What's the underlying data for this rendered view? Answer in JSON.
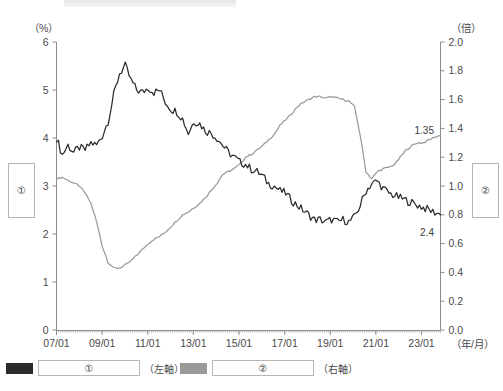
{
  "axes": {
    "left_unit": "（%）",
    "right_unit": "（倍）",
    "x_unit": "（年/月）",
    "left_ticks": [
      "0",
      "1",
      "2",
      "3",
      "4",
      "5",
      "6"
    ],
    "right_ticks": [
      "0.0",
      "0.2",
      "0.4",
      "0.6",
      "0.8",
      "1.0",
      "1.2",
      "1.4",
      "1.6",
      "1.8",
      "2.0"
    ],
    "x_ticks": [
      "07/01",
      "09/01",
      "11/01",
      "13/01",
      "15/01",
      "17/01",
      "19/01",
      "21/01",
      "23/01"
    ]
  },
  "annotations": {
    "series2_end": "1.35",
    "series1_end": "2.4"
  },
  "side_boxes": {
    "left": "①",
    "right": "②"
  },
  "legend": {
    "items": [
      {
        "swatch": "#2b2b2b",
        "key": "①",
        "axis": "（左軸）"
      },
      {
        "swatch": "#9a9a9a",
        "key": "②",
        "axis": "（右軸）"
      }
    ]
  },
  "chart_data": {
    "type": "line",
    "title": "",
    "xlabel": "（年/月）",
    "ylabel": "（%）",
    "y2label": "（倍）",
    "ylim": [
      0,
      6
    ],
    "y2lim": [
      0.0,
      2.0
    ],
    "xlim": [
      "07/01",
      "23/10"
    ],
    "grid": false,
    "legend_position": "bottom-left",
    "x": [
      "07/01",
      "07/04",
      "07/07",
      "07/10",
      "08/01",
      "08/04",
      "08/07",
      "08/10",
      "09/01",
      "09/04",
      "09/07",
      "09/10",
      "10/01",
      "10/04",
      "10/07",
      "10/10",
      "11/01",
      "11/04",
      "11/07",
      "11/10",
      "12/01",
      "12/04",
      "12/07",
      "12/10",
      "13/01",
      "13/04",
      "13/07",
      "13/10",
      "14/01",
      "14/04",
      "14/07",
      "14/10",
      "15/01",
      "15/04",
      "15/07",
      "15/10",
      "16/01",
      "16/04",
      "16/07",
      "16/10",
      "17/01",
      "17/04",
      "17/07",
      "17/10",
      "18/01",
      "18/04",
      "18/07",
      "18/10",
      "19/01",
      "19/04",
      "19/07",
      "19/10",
      "20/01",
      "20/04",
      "20/07",
      "20/10",
      "21/01",
      "21/04",
      "21/07",
      "21/10",
      "22/01",
      "22/04",
      "22/07",
      "22/10",
      "23/01",
      "23/04",
      "23/07",
      "23/10"
    ],
    "series": [
      {
        "name": "①",
        "axis": "left",
        "color": "#2b2b2b",
        "unit": "%",
        "end_label": "2.4",
        "values": [
          4.0,
          3.65,
          3.85,
          3.7,
          3.8,
          3.75,
          3.9,
          3.85,
          4.05,
          4.35,
          4.9,
          5.35,
          5.5,
          5.2,
          5.0,
          4.95,
          5.05,
          4.95,
          5.0,
          4.75,
          4.6,
          4.55,
          4.4,
          4.1,
          4.35,
          4.3,
          4.15,
          4.1,
          4.0,
          3.85,
          3.7,
          3.6,
          3.5,
          3.45,
          3.35,
          3.3,
          3.2,
          3.05,
          3.0,
          2.9,
          2.85,
          2.7,
          2.6,
          2.5,
          2.4,
          2.3,
          2.3,
          2.25,
          2.3,
          2.25,
          2.3,
          2.25,
          2.35,
          2.6,
          2.9,
          3.05,
          3.1,
          2.95,
          2.85,
          2.8,
          2.75,
          2.7,
          2.65,
          2.6,
          2.55,
          2.5,
          2.45,
          2.4
        ]
      },
      {
        "name": "②",
        "axis": "right",
        "color": "#9a9a9a",
        "unit": "倍",
        "end_label": "1.35",
        "values": [
          1.05,
          1.06,
          1.04,
          1.02,
          1.0,
          0.95,
          0.88,
          0.75,
          0.58,
          0.47,
          0.43,
          0.43,
          0.45,
          0.48,
          0.52,
          0.56,
          0.6,
          0.63,
          0.65,
          0.68,
          0.72,
          0.76,
          0.8,
          0.82,
          0.85,
          0.88,
          0.92,
          0.97,
          1.02,
          1.08,
          1.1,
          1.12,
          1.15,
          1.2,
          1.22,
          1.25,
          1.28,
          1.32,
          1.36,
          1.42,
          1.46,
          1.5,
          1.55,
          1.58,
          1.6,
          1.62,
          1.62,
          1.61,
          1.62,
          1.61,
          1.6,
          1.59,
          1.55,
          1.35,
          1.1,
          1.05,
          1.1,
          1.12,
          1.13,
          1.15,
          1.2,
          1.25,
          1.28,
          1.3,
          1.3,
          1.32,
          1.34,
          1.35
        ]
      }
    ]
  }
}
